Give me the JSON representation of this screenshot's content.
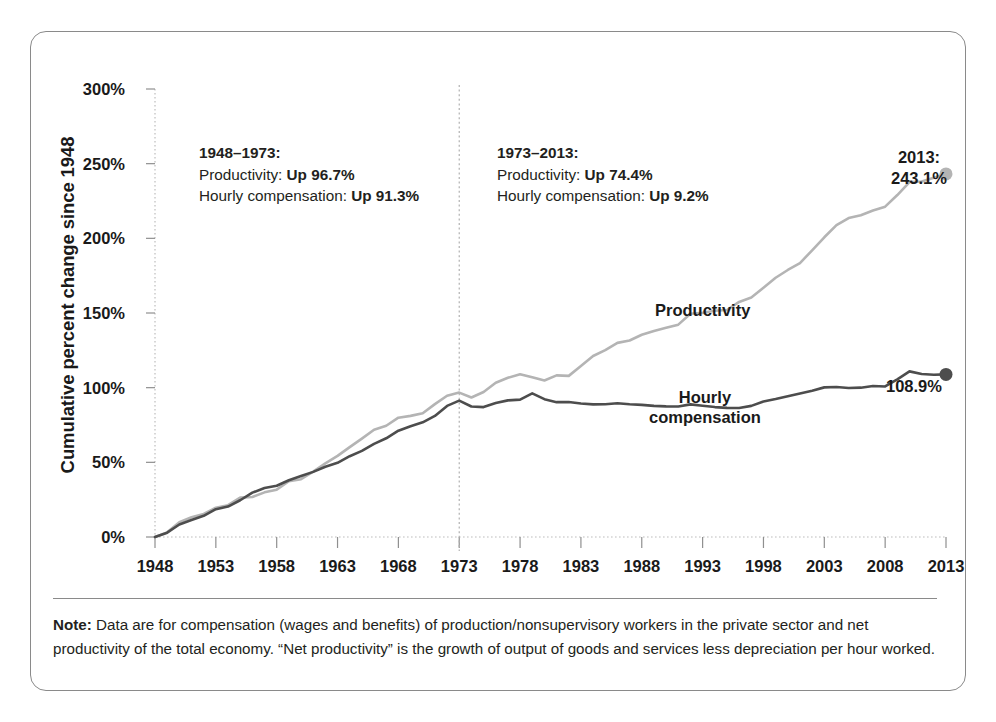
{
  "chart_data": {
    "type": "line",
    "title": "",
    "xlabel": "",
    "ylabel": "Cumulative percent change since 1948",
    "xlim": [
      1948,
      2013
    ],
    "ylim": [
      0,
      300
    ],
    "ytick_labels": [
      "0%",
      "50%",
      "100%",
      "150%",
      "200%",
      "250%",
      "300%"
    ],
    "ytick_values": [
      0,
      50,
      100,
      150,
      200,
      250,
      300
    ],
    "xtick_values": [
      1948,
      1953,
      1958,
      1963,
      1968,
      1973,
      1978,
      1983,
      1988,
      1993,
      1998,
      2003,
      2008,
      2013
    ],
    "xtick_labels": [
      "1948",
      "1953",
      "1958",
      "1963",
      "1968",
      "1973",
      "1978",
      "1983",
      "1988",
      "1993",
      "1998",
      "2003",
      "2008",
      "2013"
    ],
    "grid": false,
    "legend_position": "inline-annotation",
    "divider_year": 1973,
    "series": [
      {
        "name": "Productivity",
        "color": "#b4b4b4",
        "endpoint_value": 243.1,
        "endpoint_label": "243.1%",
        "x": [
          1948,
          1949,
          1950,
          1951,
          1952,
          1953,
          1954,
          1955,
          1956,
          1957,
          1958,
          1959,
          1960,
          1961,
          1962,
          1963,
          1964,
          1965,
          1966,
          1967,
          1968,
          1969,
          1970,
          1971,
          1972,
          1973,
          1974,
          1975,
          1976,
          1977,
          1978,
          1979,
          1980,
          1981,
          1982,
          1983,
          1984,
          1985,
          1986,
          1987,
          1988,
          1989,
          1990,
          1991,
          1992,
          1993,
          1994,
          1995,
          1996,
          1997,
          1998,
          1999,
          2000,
          2001,
          2002,
          2003,
          2004,
          2005,
          2006,
          2007,
          2008,
          2009,
          2010,
          2011,
          2012,
          2013
        ],
        "values": [
          0,
          3.1,
          9.9,
          13.2,
          15.4,
          19.6,
          21.3,
          26.4,
          26.8,
          29.9,
          31.7,
          37.3,
          38.7,
          43.8,
          49.3,
          54.3,
          60.2,
          65.9,
          71.8,
          74.5,
          79.9,
          81.1,
          82.9,
          89.0,
          94.6,
          96.7,
          93.4,
          97.1,
          103.3,
          106.6,
          109.0,
          107.0,
          104.8,
          108.2,
          107.9,
          114.5,
          121.2,
          125.1,
          130.0,
          131.6,
          135.4,
          138.0,
          140.1,
          142.2,
          149.5,
          150.1,
          151.5,
          152.0,
          157.4,
          160.4,
          166.9,
          173.6,
          178.8,
          183.4,
          192.0,
          200.7,
          208.8,
          213.6,
          215.5,
          218.6,
          221.2,
          229.0,
          237.7,
          238.1,
          240.5,
          243.1
        ]
      },
      {
        "name": "Hourly compensation",
        "color": "#4d4d4d",
        "endpoint_value": 108.9,
        "endpoint_label": "108.9%",
        "x": [
          1948,
          1949,
          1950,
          1951,
          1952,
          1953,
          1954,
          1955,
          1956,
          1957,
          1958,
          1959,
          1960,
          1961,
          1962,
          1963,
          1964,
          1965,
          1966,
          1967,
          1968,
          1969,
          1970,
          1971,
          1972,
          1973,
          1974,
          1975,
          1976,
          1977,
          1978,
          1979,
          1980,
          1981,
          1982,
          1983,
          1984,
          1985,
          1986,
          1987,
          1988,
          1989,
          1990,
          1991,
          1992,
          1993,
          1994,
          1995,
          1996,
          1997,
          1998,
          1999,
          2000,
          2001,
          2002,
          2003,
          2004,
          2005,
          2006,
          2007,
          2008,
          2009,
          2010,
          2011,
          2012,
          2013
        ],
        "values": [
          0,
          2.9,
          8.4,
          11.4,
          14.2,
          18.6,
          20.4,
          24.6,
          29.7,
          32.8,
          34.3,
          38.0,
          40.9,
          43.6,
          47.0,
          49.7,
          54.1,
          57.7,
          62.4,
          66.1,
          71.2,
          74.2,
          76.8,
          81.1,
          87.8,
          91.3,
          87.4,
          87.0,
          89.7,
          91.5,
          92.0,
          96.2,
          92.3,
          90.3,
          90.4,
          89.4,
          88.8,
          88.9,
          89.6,
          88.9,
          88.5,
          87.8,
          87.5,
          87.4,
          88.8,
          87.9,
          87.0,
          86.5,
          86.4,
          87.8,
          90.8,
          92.4,
          94.3,
          96.1,
          98.0,
          100.2,
          100.4,
          99.8,
          100.0,
          101.1,
          100.8,
          105.6,
          110.9,
          109.2,
          108.6,
          108.9
        ]
      }
    ],
    "annotations": [
      {
        "id": "period-1948-1973",
        "heading": "1948–1973:",
        "lines": [
          {
            "prefix": "Productivity: ",
            "value": "Up 96.7%"
          },
          {
            "prefix": "Hourly compensation: ",
            "value": "Up 91.3%"
          }
        ]
      },
      {
        "id": "period-1973-2013",
        "heading": "1973–2013:",
        "lines": [
          {
            "prefix": "Productivity: ",
            "value": "Up 74.4%"
          },
          {
            "prefix": "Hourly compensation: ",
            "value": "Up 9.2%"
          }
        ]
      }
    ],
    "endpoint_callouts": [
      {
        "id": "productivity-endpoint",
        "year_label": "2013:",
        "value_label": "243.1%"
      },
      {
        "id": "compensation-endpoint",
        "year_label": "",
        "value_label": "108.9%"
      }
    ]
  },
  "series_labels": {
    "productivity": "Productivity",
    "compensation_line1": "Hourly",
    "compensation_line2": "compensation"
  },
  "note": {
    "label": "Note:",
    "text": " Data are for compensation (wages and benefits) of production/nonsupervisory workers in the private sector and net productivity of the total economy. “Net productivity” is the growth of output of goods and services less depreciation per hour worked."
  }
}
